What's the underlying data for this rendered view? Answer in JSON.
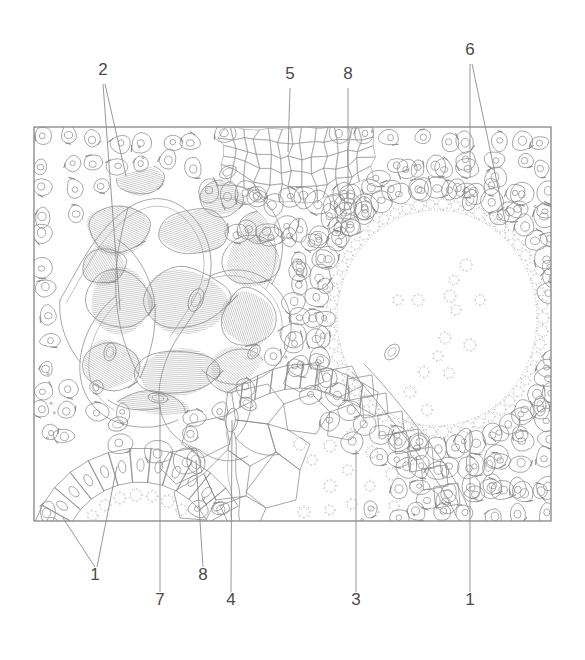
{
  "figure": {
    "type": "anatomical-line-drawing",
    "title": "",
    "background_color": "#ffffff",
    "ink_color": "#8a8a8a",
    "label_color": "#4a4a4a",
    "frame": {
      "x": 34,
      "y": 127,
      "width": 517,
      "height": 394,
      "stroke": "#6f6f6f"
    }
  },
  "labels": [
    {
      "id": "label-2",
      "text": "2",
      "x": 103,
      "y": 75,
      "leaders": 2
    },
    {
      "id": "label-5",
      "text": "5",
      "x": 290,
      "y": 79,
      "leaders": 1
    },
    {
      "id": "label-8-top",
      "text": "8",
      "x": 348,
      "y": 79,
      "leaders": 1
    },
    {
      "id": "label-6",
      "text": "6",
      "x": 470,
      "y": 55,
      "leaders": 2
    },
    {
      "id": "label-1-bottom-left",
      "text": "1",
      "x": 95,
      "y": 580,
      "leaders": 2
    },
    {
      "id": "label-7",
      "text": "7",
      "x": 160,
      "y": 605,
      "leaders": 1
    },
    {
      "id": "label-8-bottom",
      "text": "8",
      "x": 203,
      "y": 580,
      "leaders": 1
    },
    {
      "id": "label-4",
      "text": "4",
      "x": 231,
      "y": 605,
      "leaders": 1
    },
    {
      "id": "label-3",
      "text": "3",
      "x": 356,
      "y": 605,
      "leaders": 1
    },
    {
      "id": "label-1-bottom-right",
      "text": "1",
      "x": 470,
      "y": 605,
      "leaders": 1
    }
  ],
  "structures": [
    {
      "name": "branching-gland-plexus",
      "region": "upper-left",
      "label_ref": "2"
    },
    {
      "name": "hatched-interstitium",
      "region": "left",
      "label_ref": "7"
    },
    {
      "name": "fine-mesh-reticulum",
      "region": "top-center",
      "label_ref": "5"
    },
    {
      "name": "ring-cell",
      "region": "top-center-right",
      "label_ref": "8"
    },
    {
      "name": "large-follicle-lumen",
      "region": "right",
      "label_ref": "6"
    },
    {
      "name": "cuboidal-epithelium-lining",
      "region": "right",
      "label_ref": "6"
    },
    {
      "name": "polygonal-cell-mass",
      "region": "bottom-center",
      "label_ref": "3"
    },
    {
      "name": "columnar-epithelium-arc",
      "region": "bottom-left",
      "label_ref": "1"
    },
    {
      "name": "epithelium-right",
      "region": "bottom-right",
      "label_ref": "1"
    },
    {
      "name": "small-vessel",
      "region": "bottom-center-left",
      "label_ref": "4"
    }
  ]
}
